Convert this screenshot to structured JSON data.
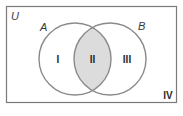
{
  "diagram": {
    "type": "venn",
    "universe_label": "U",
    "sets": [
      {
        "label": "A",
        "cx": 75,
        "cy": 59,
        "r": 36
      },
      {
        "label": "B",
        "cx": 110,
        "cy": 59,
        "r": 36
      }
    ],
    "regions": [
      {
        "label": "I",
        "description": "A only",
        "shaded": false
      },
      {
        "label": "II",
        "description": "A and B",
        "shaded": true
      },
      {
        "label": "III",
        "description": "B only",
        "shaded": false
      },
      {
        "label": "IV",
        "description": "outside A and B",
        "shaded": false
      }
    ],
    "colors": {
      "border": "#7a7a7a",
      "circle_stroke": "#8a8a8a",
      "shade": "#dcdcdc",
      "background": "#ffffff",
      "text": "#2a2a2a"
    }
  }
}
